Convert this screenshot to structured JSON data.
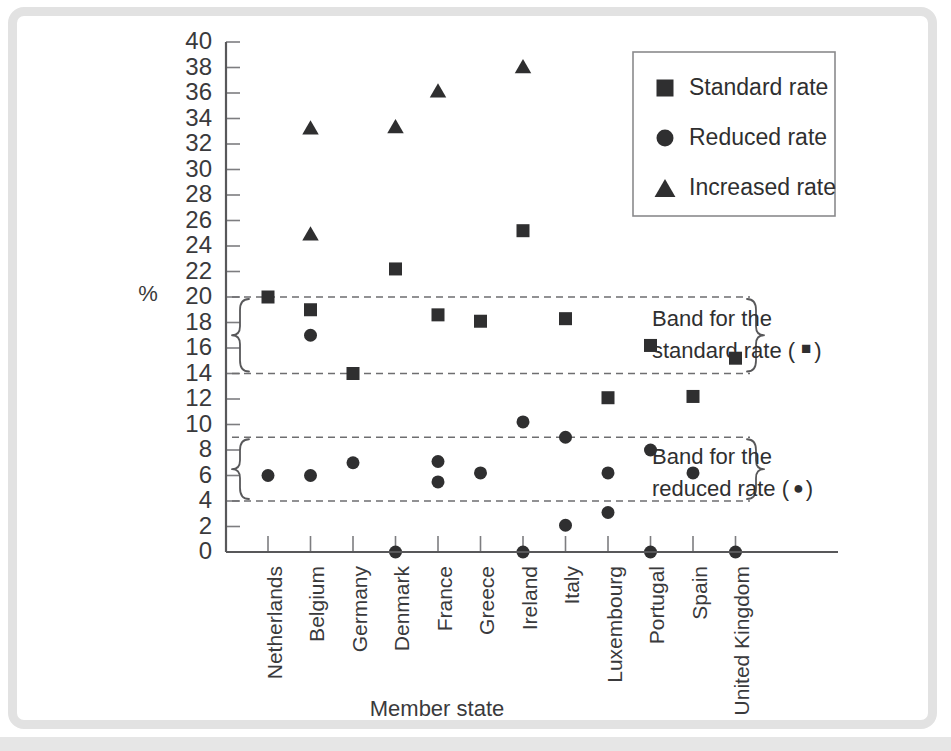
{
  "chart_data": {
    "type": "scatter",
    "title": "",
    "xlabel": "Member state",
    "ylabel": "%",
    "ylim": [
      0,
      40
    ],
    "ytick_step": 2,
    "grid": false,
    "legend_position": "top-right",
    "categories": [
      "Netherlands",
      "Belgium",
      "Germany",
      "Denmark",
      "France",
      "Greece",
      "Ireland",
      "Italy",
      "Luxembourg",
      "Portugal",
      "Spain",
      "United Kingdom"
    ],
    "ytick_labels": [
      "0",
      "2",
      "4",
      "6",
      "8",
      "10",
      "12",
      "14",
      "16",
      "18",
      "20",
      "22",
      "24",
      "26",
      "28",
      "30",
      "32",
      "34",
      "36",
      "38",
      "40"
    ],
    "series": [
      {
        "name": "Standard rate",
        "marker": "square",
        "points": [
          {
            "category": "Netherlands",
            "value": 20.0
          },
          {
            "category": "Belgium",
            "value": 19.0
          },
          {
            "category": "Germany",
            "value": 14.0
          },
          {
            "category": "Denmark",
            "value": 22.2
          },
          {
            "category": "France",
            "value": 18.6
          },
          {
            "category": "Greece",
            "value": 18.1
          },
          {
            "category": "Ireland",
            "value": 25.2
          },
          {
            "category": "Italy",
            "value": 18.3
          },
          {
            "category": "Luxembourg",
            "value": 12.1
          },
          {
            "category": "Portugal",
            "value": 16.2
          },
          {
            "category": "Spain",
            "value": 12.2
          },
          {
            "category": "United Kingdom",
            "value": 15.2
          }
        ]
      },
      {
        "name": "Reduced  rate",
        "marker": "circle",
        "points": [
          {
            "category": "Netherlands",
            "value": 6.0
          },
          {
            "category": "Belgium",
            "value": 17.0
          },
          {
            "category": "Belgium",
            "value": 6.0
          },
          {
            "category": "Germany",
            "value": 7.0
          },
          {
            "category": "Denmark",
            "value": 0.0
          },
          {
            "category": "France",
            "value": 7.1
          },
          {
            "category": "France",
            "value": 5.5
          },
          {
            "category": "Greece",
            "value": 6.2
          },
          {
            "category": "Ireland",
            "value": 10.2
          },
          {
            "category": "Ireland",
            "value": 0.0
          },
          {
            "category": "Italy",
            "value": 9.0
          },
          {
            "category": "Italy",
            "value": 2.1
          },
          {
            "category": "Luxembourg",
            "value": 6.2
          },
          {
            "category": "Luxembourg",
            "value": 3.1
          },
          {
            "category": "Portugal",
            "value": 8.0
          },
          {
            "category": "Portugal",
            "value": 0.0
          },
          {
            "category": "Spain",
            "value": 6.2
          },
          {
            "category": "United Kingdom",
            "value": 0.0
          }
        ]
      },
      {
        "name": "Increased rate",
        "marker": "triangle",
        "points": [
          {
            "category": "Belgium",
            "value": 33.3
          },
          {
            "category": "Belgium",
            "value": 25.0
          },
          {
            "category": "Denmark",
            "value": 33.4
          },
          {
            "category": "France",
            "value": 36.2
          },
          {
            "category": "Ireland",
            "value": 38.1
          },
          {
            "category": "Spain",
            "value": 33.5
          }
        ]
      }
    ],
    "bands": [
      {
        "name": "standard",
        "low": 14.0,
        "high": 20.0,
        "label_line1": "Band for the",
        "label_line2": "standard rate (",
        "label_marker": "square",
        "label_close": ")"
      },
      {
        "name": "reduced",
        "low": 4.0,
        "high": 9.0,
        "label_line1": "Band for the",
        "label_line2": "reduced rate (",
        "label_marker": "circle",
        "label_close": ")"
      }
    ]
  },
  "legend": {
    "items": [
      {
        "label": "Standard rate",
        "marker": "square"
      },
      {
        "label": "Reduced  rate",
        "marker": "circle"
      },
      {
        "label": "Increased rate",
        "marker": "triangle"
      }
    ]
  },
  "annotations": {
    "standard_band": {
      "line1": "Band for the",
      "line2_prefix": "standard rate (",
      "line2_suffix": ")"
    },
    "reduced_band": {
      "line1": "Band for the",
      "line2_prefix": "reduced rate (",
      "line2_suffix": ")"
    }
  },
  "axes": {
    "x_title": "Member state",
    "y_title": "%"
  },
  "colors": {
    "marker": "#2f2f30",
    "axis": "#58585a",
    "band": "#6e6e70",
    "frame": "#e2e2e2",
    "text": "#3a3a3c"
  }
}
